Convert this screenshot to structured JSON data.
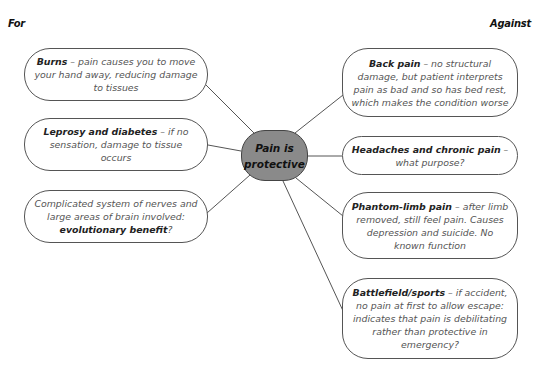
{
  "headings": {
    "for": "For",
    "against": "Against"
  },
  "center": {
    "line1": "Pain is",
    "line2": "protective",
    "fill": "#8a8a8a"
  },
  "for_items": [
    {
      "title": "Burns",
      "text": " – pain causes you to move your hand away, reducing damage to tissues"
    },
    {
      "title": "Leprosy and diabetes",
      "text": " – if no sensation, damage to tissue occurs"
    },
    {
      "pre": "Complicated system of nerves and large areas of brain involved: ",
      "title": "evolutionary benefit",
      "text": "?"
    }
  ],
  "against_items": [
    {
      "title": "Back pain",
      "text": " – no structural damage, but patient interprets pain as bad and so has bed rest, which makes the condition worse"
    },
    {
      "title": "Headaches and chronic pain",
      "text": " – what purpose?"
    },
    {
      "title": "Phantom-limb pain",
      "text": " – after limb removed, still feel pain. Causes depression and suicide. No known function"
    },
    {
      "title": "Battlefield/sports",
      "text": " – if accident, no pain at first to allow escape: indicates that pain is debilitating rather than protective in emergency?"
    }
  ]
}
